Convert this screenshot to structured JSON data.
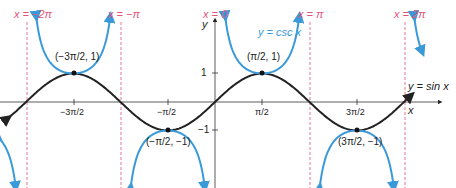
{
  "chart_data": {
    "type": "line",
    "title": "",
    "xlabel": "x",
    "ylabel": "y",
    "grid": false,
    "series": [
      {
        "name": "y = sin x",
        "color": "#222222",
        "function": "sin",
        "x_range": [
          -6.9,
          6.5
        ]
      },
      {
        "name": "y = csc x",
        "color": "#3a9ad9",
        "function": "csc",
        "x_range": [
          -6.9,
          6.9
        ]
      }
    ],
    "asymptotes": [
      {
        "label": "x = −2π",
        "x": -6.2832
      },
      {
        "label": "x = −π",
        "x": -3.1416
      },
      {
        "label": "x = 0",
        "x": 0
      },
      {
        "label": "x = π",
        "x": 3.1416
      },
      {
        "label": "x = 2π",
        "x": 6.2832
      }
    ],
    "x_ticks": [
      {
        "label": "−3π/2",
        "value": -4.7124
      },
      {
        "label": "−π/2",
        "value": -1.5708
      },
      {
        "label": "π/2",
        "value": 1.5708
      },
      {
        "label": "3π/2",
        "value": 4.7124
      }
    ],
    "y_ticks": [
      {
        "label": "1",
        "value": 1
      },
      {
        "label": "−1",
        "value": -1
      }
    ],
    "points": [
      {
        "label": "(−3π/2, 1)",
        "x": -4.7124,
        "y": 1
      },
      {
        "label": "(π/2, 1)",
        "x": 1.5708,
        "y": 1
      },
      {
        "label": "(−π/2, −1)",
        "x": -1.5708,
        "y": -1
      },
      {
        "label": "(3π/2, −1)",
        "x": 4.7124,
        "y": -1
      }
    ],
    "asymptote_color": "#e0547a"
  },
  "labels": {
    "asym_m2pi": "x = −2π",
    "asym_mpi": "x = −π",
    "asym_0": "x = 0",
    "asym_pi": "x = π",
    "asym_2pi": "x = 2π",
    "csc_label": "y = csc x",
    "sin_label": "y = sin x",
    "x_axis": "x",
    "y_axis": "y",
    "tick_y1": "1",
    "tick_ym1": "−1",
    "pt1": "(−3π/2, 1)",
    "pt2": "(π/2, 1)",
    "pt3": "(−π/2, −1)",
    "pt4": "(3π/2, −1)",
    "tick_m3pi2": "−3π/2",
    "tick_mpi2": "−π/2",
    "tick_pi2": "π/2",
    "tick_3pi2": "3π/2"
  }
}
